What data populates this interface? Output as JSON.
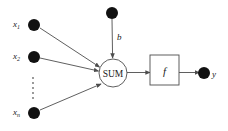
{
  "diagram": {
    "type": "artificial-neuron-model",
    "background_color": "#ffffff",
    "stroke_color": "#4d4d4d",
    "node_fill_color": "#111111",
    "text_color": "#1a1a1a",
    "inputs": [
      {
        "id": "x1",
        "label": "x",
        "subscript": "1",
        "cx": 34,
        "cy": 25,
        "r": 6
      },
      {
        "id": "x2",
        "label": "x",
        "subscript": "2",
        "cx": 34,
        "cy": 57,
        "r": 6
      },
      {
        "id": "xn",
        "label": "x",
        "subscript": "n",
        "cx": 34,
        "cy": 113,
        "r": 6
      }
    ],
    "ellipsis": {
      "name": "vertical-ellipsis",
      "cx": 33,
      "dots": [
        78,
        83,
        88,
        93,
        98
      ]
    },
    "bias": {
      "id": "b",
      "label": "b",
      "cx": 112,
      "cy": 13,
      "r": 6,
      "label_x": 117,
      "label_y": 34
    },
    "sum_node": {
      "label": "SUM",
      "cx": 113,
      "cy": 73,
      "r": 14
    },
    "activation_box": {
      "label": "f",
      "x": 150,
      "y": 55,
      "width": 29,
      "height": 30
    },
    "output": {
      "id": "y",
      "label": "y",
      "cx": 204,
      "cy": 73,
      "r": 6,
      "label_x": 212,
      "label_y": 78
    },
    "edges": [
      {
        "from": "x1",
        "to": "sum",
        "arrow": true
      },
      {
        "from": "x2",
        "to": "sum",
        "arrow": true
      },
      {
        "from": "xn",
        "to": "sum",
        "arrow": true
      },
      {
        "from": "bias",
        "to": "sum",
        "arrow": true
      },
      {
        "from": "sum",
        "to": "activation_box",
        "arrow": true
      },
      {
        "from": "activation_box",
        "to": "output",
        "arrow": true
      }
    ]
  }
}
